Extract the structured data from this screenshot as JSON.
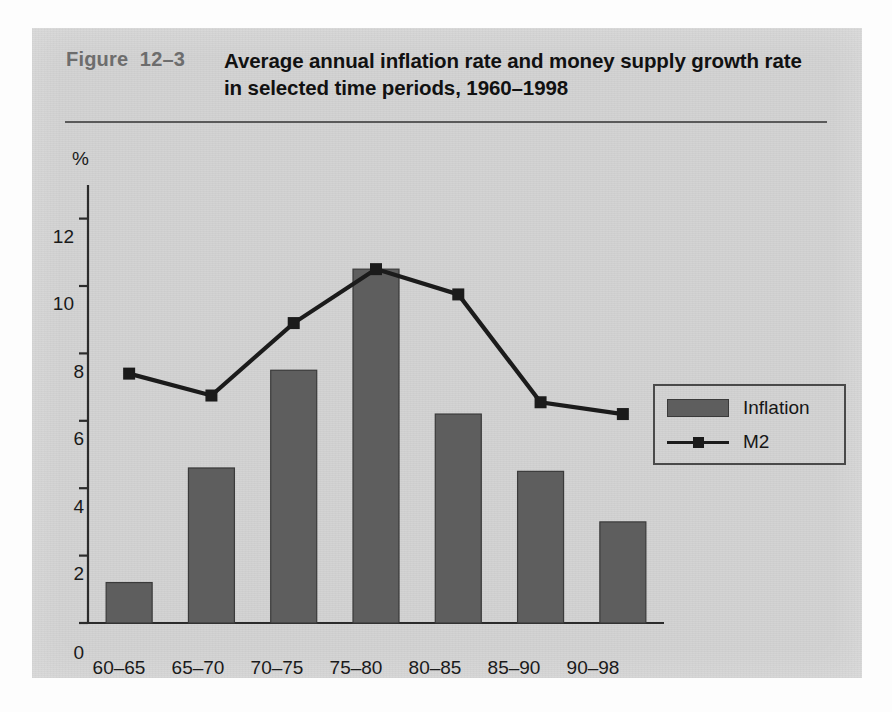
{
  "figure": {
    "number_label": "Figure  12–3",
    "title": "Average annual inflation rate and money supply growth rate in selected time periods, 1960–1998"
  },
  "axes": {
    "y_unit": "%",
    "y_tick_labels": [
      "0",
      "2",
      "4",
      "6",
      "8",
      "10",
      "12"
    ],
    "x_tick_labels": [
      "60–65",
      "65–70",
      "70–75",
      "75–80",
      "80–85",
      "85–90",
      "90–98"
    ]
  },
  "legend": {
    "position": "right-middle",
    "items": [
      {
        "label": "Inflation",
        "type": "bar",
        "color": "#5e5e5e"
      },
      {
        "label": "M2",
        "type": "line",
        "color": "#1b1b1b"
      }
    ]
  },
  "colors": {
    "panel_background": "#d2d2d2",
    "bar_fill": "#5e5e5e",
    "bar_edge": "#3a3a3a",
    "line": "#1b1b1b",
    "axis": "#2b2b2b",
    "title_text": "#111111",
    "figure_number_text": "#6d6d6d"
  },
  "chart_data": {
    "type": "bar",
    "title": "Average annual inflation rate and money supply growth rate in selected time periods, 1960–1998",
    "subtitle": "",
    "xlabel": "",
    "ylabel": "%",
    "ylim": [
      0,
      13
    ],
    "yticks": [
      0,
      2,
      4,
      6,
      8,
      10,
      12
    ],
    "grid": false,
    "legend_position": "right",
    "categories": [
      "60–65",
      "65–70",
      "70–75",
      "75–80",
      "80–85",
      "85–90",
      "90–98"
    ],
    "series": [
      {
        "name": "Inflation",
        "type": "bar",
        "color": "#5e5e5e",
        "values": [
          1.2,
          4.6,
          7.5,
          10.5,
          6.2,
          4.5,
          3.0
        ]
      },
      {
        "name": "M2",
        "type": "line",
        "color": "#1b1b1b",
        "marker": "square",
        "values": [
          7.4,
          6.75,
          8.9,
          10.5,
          9.75,
          6.55,
          6.2
        ]
      }
    ]
  }
}
